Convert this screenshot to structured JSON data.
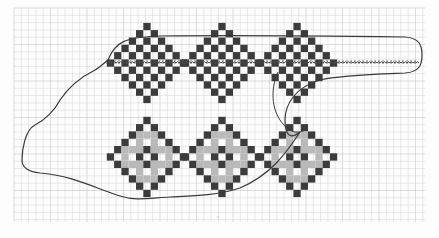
{
  "image": {
    "description": "Hand-drawn cross-stitch style pattern on graph paper",
    "background": "#fdfdfd",
    "grid": {
      "x0": 14,
      "y0": 8,
      "x1": 425,
      "y1": 222,
      "step": 7.3,
      "line_color": "#d9d9d9",
      "major_every": 5,
      "major_color": "#c8c8c8"
    },
    "colors": {
      "dark": "#3c3c3c",
      "gray": "#b9b9b9",
      "white": "#ffffff",
      "outline": "#3a3a3a",
      "stitch": "#4a4a4a"
    },
    "cell": 7.3,
    "rows": [
      {
        "name": "top-row",
        "style": "checker",
        "center_y": 63,
        "centers_x": [
          147,
          222,
          297
        ],
        "radius": 5
      },
      {
        "name": "bottom-row",
        "style": "concentric",
        "center_y": 157,
        "centers_x": [
          147,
          222,
          297
        ],
        "radius": 5
      }
    ],
    "stitch_line": {
      "x_start": 107,
      "x_end": 418,
      "y": 63
    },
    "outline_path": "M 108 60 C 115 42, 125 37, 160 36 C 230 35, 330 36, 405 37 C 420 38, 422 46, 422 55 C 422 64, 420 72, 405 73 C 380 74, 340 75, 320 80 C 295 87, 285 105, 285 120 C 285 135, 290 140, 300 132 C 285 155, 270 175, 240 188 C 215 196, 190 196, 170 197 C 150 198, 135 201, 120 196 C 95 188, 70 175, 40 173 C 30 172, 22 168, 22 160 C 22 150, 25 130, 35 125 C 45 120, 55 110, 60 100 C 70 85, 85 75, 95 70 C 100 67, 104 63, 108 60 Z",
    "extra_curve": "M 278 72 C 272 85, 270 105, 280 120 C 290 135, 300 133, 305 130",
    "mark": {
      "x": 218,
      "y": 217
    }
  }
}
